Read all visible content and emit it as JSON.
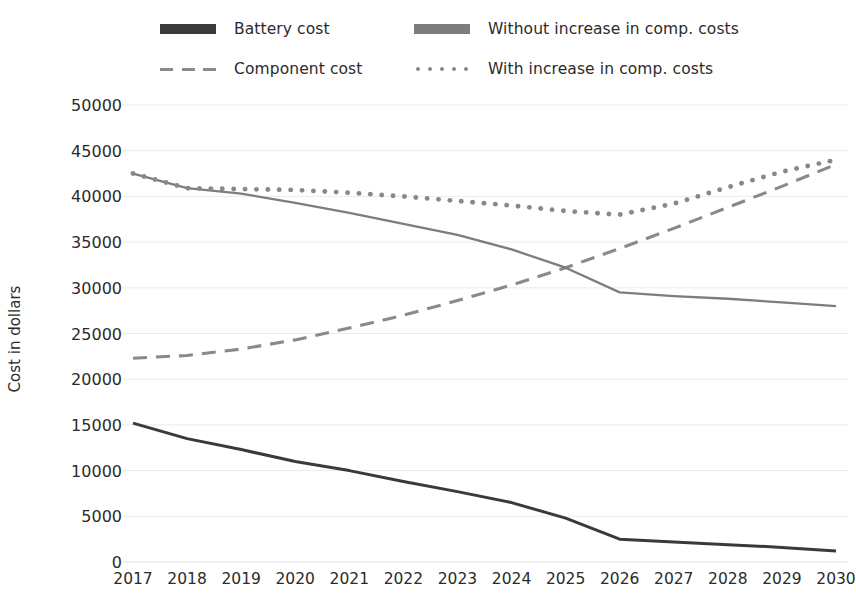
{
  "chart_data": {
    "type": "line",
    "title": "",
    "xlabel": "",
    "ylabel": "Cost in dollars",
    "x": [
      2017,
      2018,
      2019,
      2020,
      2021,
      2022,
      2023,
      2024,
      2025,
      2026,
      2027,
      2028,
      2029,
      2030
    ],
    "categories": [
      "2017",
      "2018",
      "2019",
      "2020",
      "2021",
      "2022",
      "2023",
      "2024",
      "2025",
      "2026",
      "2027",
      "2028",
      "2029",
      "2030"
    ],
    "ylim": [
      0,
      50000
    ],
    "xlim": [
      2017,
      2030
    ],
    "ytick_labels": [
      "0",
      "5000",
      "10000",
      "15000",
      "20000",
      "25000",
      "30000",
      "35000",
      "40000",
      "45000",
      "50000"
    ],
    "ytick_values": [
      0,
      5000,
      10000,
      15000,
      20000,
      25000,
      30000,
      35000,
      40000,
      45000,
      50000
    ],
    "grid": true,
    "grid_axis": "y",
    "legend_position": "top",
    "legend_columns": 2,
    "series": [
      {
        "name": "Battery cost",
        "style": "solid",
        "marker": "bar",
        "color": "#3a3a3a",
        "values": [
          15200,
          13500,
          12300,
          11000,
          10000,
          8800,
          7700,
          6500,
          4800,
          2500,
          2200,
          1900,
          1600,
          1200
        ]
      },
      {
        "name": "Component cost",
        "style": "dashed",
        "marker": "dashes",
        "color": "#8a8a8a",
        "values": [
          22300,
          22600,
          23300,
          24300,
          25600,
          27000,
          28600,
          30300,
          32200,
          34300,
          36500,
          38800,
          41100,
          43500
        ]
      },
      {
        "name": "Without increase in comp. costs",
        "style": "solid",
        "marker": "bar",
        "color": "#7d7d7d",
        "values": [
          42500,
          40900,
          40300,
          39300,
          38200,
          37000,
          35800,
          34200,
          32200,
          29500,
          29100,
          28800,
          28400,
          28000
        ]
      },
      {
        "name": "With increase in comp. costs",
        "style": "dotted",
        "marker": "dots",
        "color": "#888888",
        "values": [
          42500,
          40900,
          40800,
          40700,
          40400,
          40000,
          39500,
          39000,
          38400,
          38000,
          39200,
          41000,
          42700,
          44000
        ]
      }
    ]
  },
  "legend": {
    "items": [
      {
        "label": "Battery cost",
        "marker": "bar",
        "color": "#3a3a3a"
      },
      {
        "label": "Component cost",
        "marker": "dashes",
        "color": "#8a8a8a"
      },
      {
        "label": "Without increase in comp. costs",
        "marker": "bar",
        "color": "#7d7d7d"
      },
      {
        "label": "With increase in comp. costs",
        "marker": "dots",
        "color": "#888888"
      }
    ]
  },
  "colors": {
    "background": "#ffffff",
    "text": "#2b2b2b",
    "grid": "#ebebeb",
    "battery": "#3a3a3a",
    "component": "#8a8a8a",
    "without_increase": "#7d7d7d",
    "with_increase": "#888888"
  }
}
